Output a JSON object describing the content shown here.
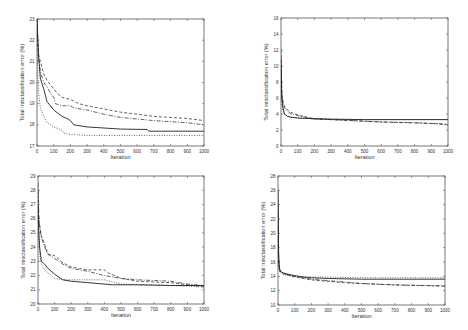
{
  "figure": {
    "width": 468,
    "height": 330,
    "line_color": "#222222",
    "axis_color": "#555555",
    "text_color": "#333333"
  },
  "chart_data": [
    {
      "id": "top-left",
      "type": "line",
      "title": "",
      "xlabel": "Iteration",
      "ylabel": "Total misclassification error (%)",
      "xlim": [
        0,
        1000
      ],
      "ylim": [
        17,
        23
      ],
      "xticks": [
        0,
        100,
        200,
        300,
        400,
        500,
        600,
        700,
        800,
        900,
        1000
      ],
      "yticks": [
        17,
        18,
        19,
        20,
        21,
        22,
        23
      ],
      "grid": false,
      "legend": null,
      "box": {
        "x": 37,
        "y": 19,
        "w": 167,
        "h": 127
      },
      "series": [
        {
          "name": "solid",
          "style": "solid",
          "x": [
            0,
            5,
            10,
            20,
            40,
            60,
            80,
            100,
            150,
            180,
            200,
            220,
            300,
            400,
            500,
            660,
            670,
            800,
            1000
          ],
          "y": [
            23,
            22,
            21.2,
            20.2,
            19.7,
            19.1,
            18.9,
            18.7,
            18.4,
            18.3,
            18.2,
            18.0,
            17.9,
            17.85,
            17.8,
            17.78,
            17.7,
            17.7,
            17.7
          ]
        },
        {
          "name": "dashed",
          "style": "dashed",
          "x": [
            0,
            5,
            10,
            20,
            40,
            60,
            80,
            100,
            120,
            150,
            200,
            250,
            300,
            400,
            500,
            700,
            900,
            1000
          ],
          "y": [
            23,
            22,
            21.3,
            21.0,
            20.4,
            20.1,
            19.9,
            19.7,
            19.5,
            19.3,
            19.2,
            19.0,
            18.9,
            18.75,
            18.6,
            18.4,
            18.3,
            18.2
          ]
        },
        {
          "name": "dash-dot",
          "style": "dashdot",
          "x": [
            0,
            5,
            10,
            20,
            40,
            60,
            80,
            100,
            110,
            150,
            200,
            220,
            300,
            400,
            500,
            700,
            900,
            1000
          ],
          "y": [
            23,
            21.8,
            21.2,
            20.5,
            20.0,
            19.8,
            19.5,
            19.3,
            19.0,
            18.9,
            18.9,
            18.8,
            18.7,
            18.5,
            18.35,
            18.2,
            18.1,
            18.0
          ]
        },
        {
          "name": "dotted",
          "style": "dotted",
          "x": [
            0,
            5,
            10,
            20,
            40,
            60,
            80,
            100,
            150,
            160,
            200,
            300,
            500,
            700,
            1000
          ],
          "y": [
            22,
            20.5,
            19.5,
            18.8,
            18.4,
            18.1,
            18.0,
            17.9,
            17.75,
            17.6,
            17.55,
            17.5,
            17.5,
            17.5,
            17.5
          ]
        }
      ]
    },
    {
      "id": "top-right",
      "type": "line",
      "title": "",
      "xlabel": "Iteration",
      "ylabel": "Total misclassification error (%)",
      "xlim": [
        0,
        1000
      ],
      "ylim": [
        0,
        16
      ],
      "xticks": [
        0,
        100,
        200,
        300,
        400,
        500,
        600,
        700,
        800,
        900,
        1000
      ],
      "yticks": [
        0,
        2,
        4,
        6,
        8,
        10,
        12,
        14,
        16
      ],
      "grid": false,
      "legend": null,
      "box": {
        "x": 281,
        "y": 18,
        "w": 167,
        "h": 128
      },
      "series": [
        {
          "name": "solid",
          "style": "solid",
          "x": [
            0,
            5,
            10,
            20,
            40,
            60,
            100,
            150,
            200,
            300,
            500,
            1000
          ],
          "y": [
            11,
            6.0,
            5.0,
            4.0,
            3.7,
            3.6,
            3.5,
            3.45,
            3.4,
            3.35,
            3.3,
            3.3
          ]
        },
        {
          "name": "dashed",
          "style": "dashed",
          "x": [
            0,
            5,
            10,
            20,
            40,
            60,
            100,
            150,
            200,
            300,
            400,
            600,
            800,
            1000
          ],
          "y": [
            12,
            6.5,
            5.8,
            5.0,
            4.5,
            4.2,
            3.9,
            3.6,
            3.4,
            3.3,
            3.2,
            3.0,
            2.9,
            2.7
          ]
        },
        {
          "name": "dash-dot",
          "style": "dashdot",
          "x": [
            0,
            5,
            10,
            20,
            40,
            60,
            100,
            150,
            200,
            300,
            400,
            600,
            800,
            950,
            1000
          ],
          "y": [
            10,
            6.2,
            5.5,
            4.8,
            4.3,
            4.0,
            3.8,
            3.6,
            3.4,
            3.3,
            3.2,
            3.0,
            2.9,
            2.8,
            2.6
          ]
        },
        {
          "name": "dotted",
          "style": "dotted",
          "x": [
            0,
            5,
            10,
            20,
            40,
            60,
            100,
            200,
            300,
            500,
            1000
          ],
          "y": [
            9,
            5.5,
            4.5,
            4.0,
            3.7,
            3.6,
            3.5,
            3.4,
            3.35,
            3.3,
            3.3
          ]
        }
      ]
    },
    {
      "id": "bottom-left",
      "type": "line",
      "title": "",
      "xlabel": "Iteration",
      "ylabel": "Total misclassification error (%)",
      "xlim": [
        0,
        1000
      ],
      "ylim": [
        20,
        29
      ],
      "xticks": [
        0,
        100,
        200,
        300,
        400,
        500,
        600,
        700,
        800,
        900,
        1000
      ],
      "yticks": [
        20,
        21,
        22,
        23,
        24,
        25,
        26,
        27,
        28,
        29
      ],
      "grid": false,
      "legend": null,
      "box": {
        "x": 38,
        "y": 176,
        "w": 166,
        "h": 128
      },
      "series": [
        {
          "name": "solid",
          "style": "solid",
          "x": [
            0,
            5,
            10,
            20,
            40,
            60,
            100,
            150,
            200,
            300,
            450,
            600,
            800,
            1000
          ],
          "y": [
            27,
            25,
            24,
            23.0,
            22.8,
            22.5,
            22.1,
            21.7,
            21.6,
            21.5,
            21.35,
            21.35,
            21.3,
            21.3
          ]
        },
        {
          "name": "dashed",
          "style": "dashed",
          "x": [
            0,
            5,
            10,
            20,
            40,
            60,
            100,
            150,
            200,
            250,
            300,
            400,
            420,
            500,
            600,
            800,
            1000
          ],
          "y": [
            28,
            26,
            25.5,
            24.8,
            24.2,
            23.5,
            23.4,
            22.9,
            22.6,
            22.5,
            22.4,
            22.4,
            22.2,
            21.8,
            21.6,
            21.5,
            21.2
          ]
        },
        {
          "name": "dash-dot",
          "style": "dashdot",
          "x": [
            0,
            5,
            10,
            20,
            40,
            60,
            100,
            150,
            200,
            300,
            400,
            500,
            600,
            800,
            900,
            1000
          ],
          "y": [
            28.5,
            26,
            25.5,
            24.7,
            24.0,
            23.5,
            23.2,
            22.8,
            22.5,
            22.3,
            22.0,
            21.8,
            21.7,
            21.6,
            21.4,
            21.3
          ]
        },
        {
          "name": "dotted",
          "style": "dotted",
          "x": [
            0,
            5,
            10,
            20,
            40,
            60,
            100,
            150,
            200,
            300,
            400,
            500,
            800,
            1000
          ],
          "y": [
            26,
            24.5,
            23.5,
            22.8,
            22.4,
            22.2,
            21.8,
            21.7,
            21.7,
            21.7,
            21.7,
            21.4,
            21.3,
            21.2
          ]
        }
      ]
    },
    {
      "id": "bottom-right",
      "type": "line",
      "title": "",
      "xlabel": "Iteration",
      "ylabel": "Total misclassification error (%)",
      "xlim": [
        0,
        1000
      ],
      "ylim": [
        10,
        28
      ],
      "xticks": [
        0,
        100,
        200,
        300,
        400,
        500,
        600,
        700,
        800,
        900,
        1000
      ],
      "yticks": [
        10,
        12,
        14,
        16,
        18,
        20,
        22,
        24,
        26,
        28
      ],
      "grid": false,
      "legend": null,
      "box": {
        "x": 278,
        "y": 176,
        "w": 167,
        "h": 129
      },
      "series": [
        {
          "name": "solid",
          "style": "solid",
          "x": [
            0,
            3,
            6,
            10,
            20,
            40,
            60,
            100,
            150,
            200,
            300,
            500,
            1000
          ],
          "y": [
            26,
            18,
            16,
            15,
            14.6,
            14.4,
            14.3,
            14.1,
            13.9,
            13.8,
            13.7,
            13.6,
            13.6
          ]
        },
        {
          "name": "dashed",
          "style": "dashed",
          "x": [
            0,
            3,
            6,
            10,
            20,
            40,
            60,
            100,
            150,
            200,
            300,
            400,
            500,
            700,
            900,
            1000
          ],
          "y": [
            24,
            17,
            15.5,
            14.8,
            14.5,
            14.3,
            14.2,
            13.9,
            13.7,
            13.5,
            13.3,
            13.1,
            13.0,
            12.8,
            12.7,
            12.6
          ]
        },
        {
          "name": "dash-dot",
          "style": "dashdot",
          "x": [
            0,
            3,
            6,
            10,
            20,
            40,
            60,
            100,
            150,
            200,
            300,
            400,
            500,
            700,
            900,
            1000
          ],
          "y": [
            23,
            16.5,
            15.2,
            14.9,
            14.6,
            14.4,
            14.2,
            14.0,
            13.8,
            13.6,
            13.4,
            13.2,
            13.0,
            12.8,
            12.7,
            12.7
          ]
        },
        {
          "name": "dotted",
          "style": "dotted",
          "x": [
            0,
            3,
            6,
            10,
            20,
            40,
            60,
            100,
            200,
            300,
            500,
            1000
          ],
          "y": [
            20,
            16,
            15.0,
            14.6,
            14.4,
            14.2,
            14.1,
            14.0,
            13.9,
            13.9,
            13.8,
            13.8
          ]
        }
      ]
    }
  ]
}
